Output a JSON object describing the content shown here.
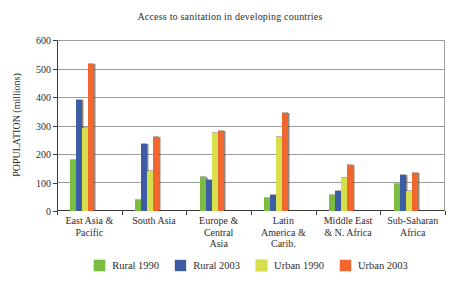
{
  "chart_data": {
    "type": "bar",
    "title": "Access to sanitation in developing countries",
    "xlabel": "",
    "ylabel": "POPULATION (millions)",
    "ylim": [
      0,
      600
    ],
    "ytick_step": 100,
    "yticks": [
      0,
      100,
      200,
      300,
      400,
      500,
      600
    ],
    "grid": "horizontal",
    "legend_position": "bottom",
    "categories": [
      "East Asia & Pacific",
      "South Asia",
      "Europe & Central Asia",
      "Latin America & Carib.",
      "Middle East & N. Africa",
      "Sub-Saharan Africa"
    ],
    "category_label_lines": [
      [
        "East Asia &",
        "Pacific"
      ],
      [
        "South Asia"
      ],
      [
        "Europe &",
        "Central",
        "Asia"
      ],
      [
        "Latin",
        "America &",
        "Carib."
      ],
      [
        "Middle East",
        "& N. Africa"
      ],
      [
        "Sub-Saharan",
        "Africa"
      ]
    ],
    "series": [
      {
        "name": "Rural 1990",
        "color": "#7abd42",
        "values": [
          180,
          40,
          120,
          45,
          55,
          95
        ]
      },
      {
        "name": "Rural 2003",
        "color": "#3d5ca6",
        "values": [
          390,
          235,
          110,
          55,
          70,
          125
        ]
      },
      {
        "name": "Urban 1990",
        "color": "#d8df4d",
        "values": [
          290,
          140,
          275,
          260,
          115,
          70
        ]
      },
      {
        "name": "Urban 2003",
        "color": "#f1662c",
        "values": [
          515,
          260,
          280,
          345,
          160,
          135
        ]
      }
    ]
  },
  "colors": {
    "text": "#2e2e2e",
    "grid": "#9b9b9b",
    "axis": "#3c3c3c",
    "paper": "#ffffff"
  }
}
